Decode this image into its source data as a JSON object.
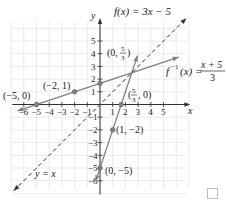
{
  "chart_data": {
    "type": "line",
    "title": "",
    "xlabel": "x",
    "ylabel": "y",
    "xlim": [
      -7,
      7
    ],
    "ylim": [
      -7,
      7
    ],
    "grid": true,
    "x_ticks": [
      -6,
      -5,
      -4,
      -3,
      -2,
      -1,
      1,
      2,
      3,
      4,
      5
    ],
    "x_tick_labels": [
      "−6",
      "−5",
      "−4",
      "−3",
      "−2",
      "−1",
      "1",
      "2",
      "3",
      "4",
      "5"
    ],
    "y_ticks": [
      5,
      4,
      3,
      2,
      1,
      -1,
      -2,
      -3,
      -4,
      -5,
      -6
    ],
    "y_tick_labels": [
      "5",
      "4",
      "3",
      "2",
      "1",
      "−1",
      "−2",
      "−3",
      "−4",
      "−5",
      "−6"
    ],
    "series": [
      {
        "name": "f(x) = 3x − 5",
        "label": "f(x) = 3x − 5",
        "slope": 3,
        "intercept": -5,
        "x_range": [
          -0.35,
          2.95
        ],
        "style": "solid",
        "color": "#808080"
      },
      {
        "name": "f⁻¹(x) = (x + 5)/3",
        "label_left": "f",
        "label_sup": "−1",
        "label_mid": "(x) =",
        "label_num": "x + 5",
        "label_den": "3",
        "slope": 0.3333,
        "intercept": 1.6667,
        "x_range": [
          -6.5,
          6.2
        ],
        "style": "solid",
        "color": "#808080"
      },
      {
        "name": "y = x",
        "label": "y = x",
        "slope": 1,
        "intercept": 0,
        "x_range": [
          -6.8,
          6.8
        ],
        "style": "dashed",
        "color": "#333333"
      }
    ],
    "points": [
      {
        "x": 0,
        "y": 1.6667,
        "label": "(0, 5/3)",
        "label_pre": "(0, ",
        "num": "5",
        "den": "3",
        "label_post": ")"
      },
      {
        "x": 1.6667,
        "y": 0,
        "label": "(5/3, 0)",
        "label_pre": "(",
        "num": "5",
        "den": "3",
        "label_post": ", 0)"
      },
      {
        "x": -2,
        "y": 1,
        "label": "(−2, 1)"
      },
      {
        "x": -5,
        "y": 0,
        "label": "(−5, 0)"
      },
      {
        "x": 1,
        "y": -2,
        "label": "(1, −2)"
      },
      {
        "x": 0,
        "y": -5,
        "label": "(0, −5)"
      }
    ]
  },
  "ui": {
    "corner_checkbox": "checkbox"
  }
}
